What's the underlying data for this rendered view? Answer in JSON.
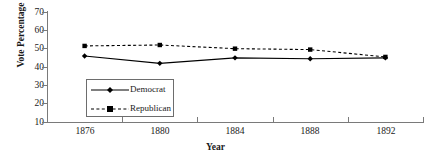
{
  "chart_data": {
    "type": "line",
    "title": "",
    "xlabel": "Year",
    "ylabel": "Vote Percentage",
    "categories": [
      "1876",
      "1880",
      "1884",
      "1888",
      "1892"
    ],
    "x": [
      1876,
      1880,
      1884,
      1888,
      1892
    ],
    "ylim": [
      10,
      70
    ],
    "yticks": [
      10,
      20,
      30,
      40,
      50,
      60,
      70
    ],
    "grid": false,
    "legend_position": "inside-lower-left",
    "series": [
      {
        "name": "Democrat",
        "values": [
          46,
          42,
          45,
          44.5,
          45
        ],
        "line_style": "solid",
        "marker": "diamond",
        "color": "#000000"
      },
      {
        "name": "Republican",
        "values": [
          51.5,
          52,
          50,
          49.5,
          45.5
        ],
        "line_style": "dashed",
        "marker": "square",
        "color": "#000000"
      }
    ]
  },
  "axes": {
    "y_title": "Vote Percentage",
    "x_title": "Year",
    "y_tick_labels": [
      "70",
      "60",
      "50",
      "40",
      "30",
      "20",
      "10"
    ],
    "x_tick_labels": [
      "1876",
      "1880",
      "1884",
      "1888",
      "1892"
    ]
  },
  "legend": {
    "entries": [
      {
        "label": "Democrat"
      },
      {
        "label": "Republican"
      }
    ]
  },
  "colors": {
    "axis": "#7a7a7a",
    "series": "#000000",
    "background": "#ffffff",
    "legend_border": "#6d6d6d"
  }
}
